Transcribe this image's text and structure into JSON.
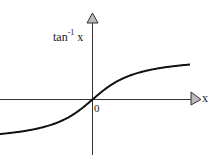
{
  "chart_data": {
    "type": "line",
    "title": "",
    "function": "arctan",
    "xlabel": "x",
    "ylabel_base": "tan",
    "ylabel_exp": "-1",
    "ylabel_var": "x",
    "origin_label": "0",
    "grid": false,
    "legend": null,
    "series": [
      {
        "name": "tan^-1 x",
        "x": [
          -3.0,
          -2.5,
          -2.0,
          -1.5,
          -1.0,
          -0.5,
          0.0,
          0.5,
          1.0,
          1.5,
          2.0,
          2.5,
          3.0
        ],
        "values": [
          -1.249,
          -1.19,
          -1.107,
          -0.983,
          -0.785,
          -0.464,
          0.0,
          0.464,
          0.785,
          0.983,
          1.107,
          1.19,
          1.249
        ]
      }
    ],
    "xlim": [
      -3.0,
      3.0
    ],
    "ylim": [
      -1.57,
      1.57
    ],
    "colors": {
      "curve": "#111111",
      "axis": "#333333",
      "arrow_fill": "#bbbbbb"
    }
  }
}
